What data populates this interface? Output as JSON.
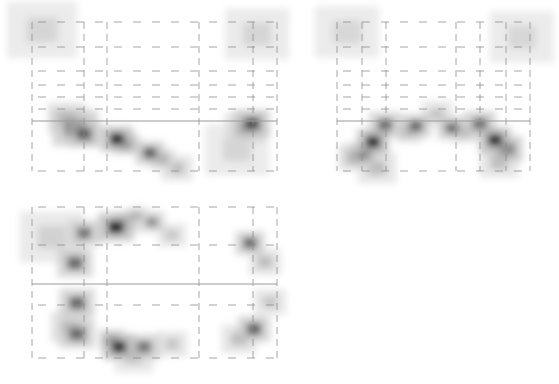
{
  "colors": {
    "background": "#ffffff",
    "grid": "#8a8a8a",
    "reference_line": "#9a9a9a",
    "density_low": "#e6e6e6",
    "density_high": "#111111"
  },
  "chart_data": [
    {
      "type": "heatmap",
      "id": "panel-top-left",
      "title": "",
      "xlabel": "",
      "ylabel": "",
      "bounds": {
        "x": 32,
        "y": 22,
        "w": 245,
        "h": 149
      },
      "grid": {
        "vertical_dashed": [
          0,
          52,
          75,
          167,
          221,
          245
        ],
        "horizontal_dashed": [
          0,
          25,
          49,
          63,
          75,
          87,
          149
        ],
        "solid_horizontal": 99
      },
      "blobs": [
        {
          "x": 10,
          "y": 8,
          "r": 22,
          "v": 0.08
        },
        {
          "x": 225,
          "y": 12,
          "r": 20,
          "v": 0.08
        },
        {
          "x": 43,
          "y": 106,
          "r": 14,
          "v": 0.65
        },
        {
          "x": 52,
          "y": 112,
          "r": 10,
          "v": 0.7
        },
        {
          "x": 35,
          "y": 96,
          "r": 12,
          "v": 0.3
        },
        {
          "x": 85,
          "y": 117,
          "r": 10,
          "v": 0.95
        },
        {
          "x": 95,
          "y": 122,
          "r": 8,
          "v": 0.55
        },
        {
          "x": 118,
          "y": 131,
          "r": 9,
          "v": 0.7
        },
        {
          "x": 130,
          "y": 137,
          "r": 8,
          "v": 0.35
        },
        {
          "x": 145,
          "y": 146,
          "r": 10,
          "v": 0.2
        },
        {
          "x": 220,
          "y": 102,
          "r": 11,
          "v": 0.75
        },
        {
          "x": 212,
          "y": 106,
          "r": 12,
          "v": 0.3
        },
        {
          "x": 205,
          "y": 128,
          "r": 20,
          "v": 0.08
        }
      ]
    },
    {
      "type": "heatmap",
      "id": "panel-top-right",
      "title": "",
      "xlabel": "",
      "ylabel": "",
      "bounds": {
        "x": 337,
        "y": 22,
        "w": 193,
        "h": 149
      },
      "grid": {
        "vertical_dashed": [
          0,
          25,
          49,
          119,
          143,
          169,
          193
        ],
        "horizontal_dashed": [
          0,
          25,
          49,
          63,
          75,
          87,
          149
        ],
        "solid_horizontal": 99
      },
      "blobs": [
        {
          "x": 10,
          "y": 10,
          "r": 20,
          "v": 0.07
        },
        {
          "x": 185,
          "y": 15,
          "r": 20,
          "v": 0.07
        },
        {
          "x": 48,
          "y": 103,
          "r": 10,
          "v": 0.6
        },
        {
          "x": 36,
          "y": 120,
          "r": 10,
          "v": 0.95
        },
        {
          "x": 27,
          "y": 132,
          "r": 9,
          "v": 0.55
        },
        {
          "x": 18,
          "y": 135,
          "r": 10,
          "v": 0.45
        },
        {
          "x": 40,
          "y": 146,
          "r": 12,
          "v": 0.2
        },
        {
          "x": 79,
          "y": 104,
          "r": 9,
          "v": 0.65
        },
        {
          "x": 72,
          "y": 110,
          "r": 8,
          "v": 0.35
        },
        {
          "x": 115,
          "y": 106,
          "r": 9,
          "v": 0.6
        },
        {
          "x": 128,
          "y": 110,
          "r": 8,
          "v": 0.3
        },
        {
          "x": 143,
          "y": 102,
          "r": 10,
          "v": 0.6
        },
        {
          "x": 158,
          "y": 118,
          "r": 10,
          "v": 0.95
        },
        {
          "x": 170,
          "y": 127,
          "r": 10,
          "v": 0.7
        },
        {
          "x": 162,
          "y": 140,
          "r": 12,
          "v": 0.2
        },
        {
          "x": 100,
          "y": 92,
          "r": 10,
          "v": 0.15
        }
      ]
    },
    {
      "type": "heatmap",
      "id": "panel-bottom-left",
      "title": "",
      "xlabel": "",
      "ylabel": "",
      "bounds": {
        "x": 32,
        "y": 207,
        "w": 245,
        "h": 151
      },
      "grid": {
        "vertical_dashed": [
          0,
          52,
          75,
          167,
          221,
          245
        ],
        "horizontal_dashed": [
          0,
          38,
          98,
          151
        ],
        "solid_horizontal": 77
      },
      "blobs": [
        {
          "x": 20,
          "y": 30,
          "r": 20,
          "v": 0.1
        },
        {
          "x": 52,
          "y": 26,
          "r": 10,
          "v": 0.55
        },
        {
          "x": 84,
          "y": 20,
          "r": 11,
          "v": 0.95
        },
        {
          "x": 95,
          "y": 15,
          "r": 8,
          "v": 0.3
        },
        {
          "x": 105,
          "y": 9,
          "r": 7,
          "v": 0.3
        },
        {
          "x": 120,
          "y": 15,
          "r": 8,
          "v": 0.45
        },
        {
          "x": 140,
          "y": 28,
          "r": 9,
          "v": 0.15
        },
        {
          "x": 43,
          "y": 56,
          "r": 11,
          "v": 0.6
        },
        {
          "x": 45,
          "y": 96,
          "r": 11,
          "v": 0.6
        },
        {
          "x": 45,
          "y": 127,
          "r": 11,
          "v": 0.6
        },
        {
          "x": 38,
          "y": 120,
          "r": 12,
          "v": 0.3
        },
        {
          "x": 80,
          "y": 133,
          "r": 8,
          "v": 0.6
        },
        {
          "x": 87,
          "y": 140,
          "r": 10,
          "v": 0.95
        },
        {
          "x": 112,
          "y": 140,
          "r": 10,
          "v": 0.55
        },
        {
          "x": 140,
          "y": 137,
          "r": 10,
          "v": 0.15
        },
        {
          "x": 102,
          "y": 150,
          "r": 12,
          "v": 0.15
        },
        {
          "x": 218,
          "y": 36,
          "r": 9,
          "v": 0.65
        },
        {
          "x": 233,
          "y": 55,
          "r": 10,
          "v": 0.2
        },
        {
          "x": 222,
          "y": 122,
          "r": 10,
          "v": 0.65
        },
        {
          "x": 207,
          "y": 132,
          "r": 11,
          "v": 0.2
        },
        {
          "x": 238,
          "y": 95,
          "r": 10,
          "v": 0.15
        }
      ]
    }
  ]
}
